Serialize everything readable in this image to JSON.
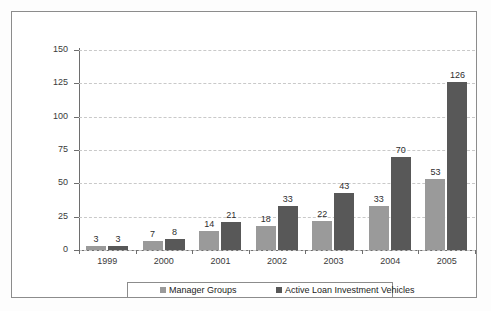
{
  "chart_data": {
    "type": "bar",
    "title": "",
    "subtitle": "",
    "xlabel": "",
    "ylabel": "",
    "categories": [
      "1999",
      "2000",
      "2001",
      "2002",
      "2003",
      "2004",
      "2005"
    ],
    "series": [
      {
        "name": "Manager Groups",
        "color": "#9a9a9a",
        "values": [
          3,
          7,
          14,
          18,
          22,
          33,
          53
        ]
      },
      {
        "name": "Active Loan Investment Vehicles",
        "color": "#585858",
        "values": [
          3,
          8,
          21,
          33,
          43,
          70,
          126
        ]
      }
    ],
    "ylim": [
      0,
      150
    ],
    "yticks": [
      0,
      25,
      50,
      75,
      100,
      125,
      150
    ],
    "ytick_labels": [
      "0",
      "25",
      "50",
      "75",
      "100",
      "125",
      "150"
    ],
    "grid": true,
    "grid_style": "dashed-horizontal",
    "data_labels": true,
    "legend_position": "bottom-center"
  },
  "legend": {
    "entries": [
      {
        "label": "Manager Groups",
        "color": "#9a9a9a"
      },
      {
        "label": "Active Loan Investment Vehicles",
        "color": "#585858"
      }
    ]
  },
  "colors": {
    "series_1": "#9a9a9a",
    "series_2": "#585858",
    "axis": "#6e6e6e",
    "gridline": "#c9c9c9",
    "frame": "#8c8c8c",
    "background": "#ffffff"
  }
}
